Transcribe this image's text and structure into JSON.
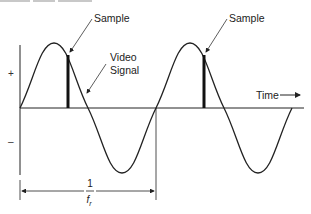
{
  "diagram": {
    "labels": {
      "sample_1": "Sample",
      "sample_2": "Sample",
      "video_signal_line1": "Video",
      "video_signal_line2": "Signal",
      "time_axis": "Time",
      "positive": "+",
      "negative": "–",
      "period_numerator": "1",
      "period_denominator": "f",
      "period_denominator_sub": "r"
    },
    "colors": {
      "stroke": "#222222",
      "background": "#ffffff"
    },
    "geometry": {
      "zero_line_y": 108,
      "axis_x": 20,
      "period_px": 136,
      "amplitude_px": 65,
      "sample_bars_x": [
        68,
        204
      ]
    }
  }
}
